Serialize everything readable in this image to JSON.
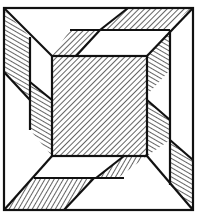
{
  "figure": {
    "colors": {
      "ink": "#111111",
      "paper": "#ffffff"
    },
    "regions": [
      {
        "name": "center-square",
        "fill": "hatch-diagonal"
      },
      {
        "name": "top-arm-outer",
        "fill": "hatch-diagonal"
      },
      {
        "name": "top-arm-inner",
        "fill": "hatch-diagonal"
      },
      {
        "name": "right-arm-outer",
        "fill": "hatch-horizontal"
      },
      {
        "name": "right-arm-inner",
        "fill": "hatch-horizontal"
      },
      {
        "name": "bottom-arm-outer",
        "fill": "hatch-diagonal"
      },
      {
        "name": "bottom-arm-inner",
        "fill": "hatch-diagonal"
      },
      {
        "name": "left-arm-outer",
        "fill": "hatch-horizontal"
      },
      {
        "name": "left-arm-inner",
        "fill": "hatch-horizontal"
      }
    ]
  }
}
